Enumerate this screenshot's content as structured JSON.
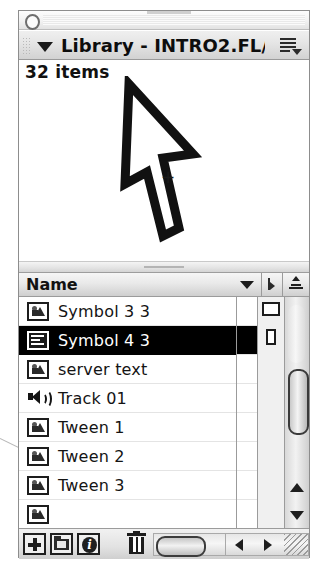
{
  "window": {
    "collapse_icon": "circle-collapse-icon",
    "title": "Library - INTRO2.FL/...",
    "disclosure_icon": "triangle-down-icon",
    "options_menu_icon": "panel-options-menu-icon",
    "grip_icon": "drag-grip-icon"
  },
  "preview": {
    "item_count": "32 items",
    "artwork_icon": "arrow-cursor-artwork",
    "crosshair_icon": "crosshair-plus-icon"
  },
  "list_header": {
    "name_column": "Name",
    "sort_icon": "sort-triangle-icon",
    "link_column_icon": "linkage-icon",
    "stack_column_icon": "stack-pyramid-icon"
  },
  "items": [
    {
      "label": "Symbol 3 3",
      "icon": "graphic-symbol-icon",
      "selected": false
    },
    {
      "label": "Symbol 4 3",
      "icon": "movie-clip-symbol-icon",
      "selected": true
    },
    {
      "label": "server text",
      "icon": "graphic-symbol-icon",
      "selected": false
    },
    {
      "label": "Track 01",
      "icon": "sound-icon",
      "selected": false
    },
    {
      "label": "Tween 1",
      "icon": "graphic-symbol-icon",
      "selected": false
    },
    {
      "label": "Tween 2",
      "icon": "graphic-symbol-icon",
      "selected": false
    },
    {
      "label": "Tween 3",
      "icon": "graphic-symbol-icon",
      "selected": false
    },
    {
      "label": "",
      "icon": "graphic-symbol-icon",
      "selected": false
    }
  ],
  "scrollbars": {
    "vertical_up_icon": "scroll-up-arrow-icon",
    "vertical_down_icon": "scroll-down-arrow-icon",
    "vertical_thumb_icon": "vertical-scroll-thumb",
    "horizontal_thumb_icon": "horizontal-scroll-thumb",
    "horizontal_left_icon": "scroll-left-arrow-icon",
    "horizontal_right_icon": "scroll-right-arrow-icon",
    "resize_grip_icon": "resize-grip-icon"
  },
  "toolbar": {
    "new_symbol_icon": "new-symbol-plus-icon",
    "new_folder_icon": "new-folder-icon",
    "properties_icon": "properties-info-icon",
    "properties_glyph": "i",
    "delete_icon": "trash-delete-icon"
  }
}
